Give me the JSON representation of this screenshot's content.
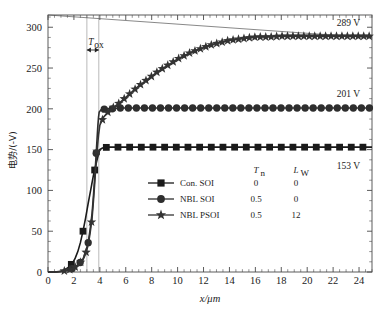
{
  "chart_data": {
    "type": "line",
    "title": "",
    "xlabel": "x/μm",
    "ylabel": "电势/(-V)",
    "ylabel_cjk": "电势",
    "ylabel_unit": "/(-V)",
    "xlim": [
      0,
      25
    ],
    "ylim": [
      0,
      315
    ],
    "xticks": [
      0,
      2,
      4,
      6,
      8,
      10,
      12,
      14,
      16,
      18,
      20,
      22,
      24
    ],
    "xtick_labels": [
      "0",
      "2",
      "4",
      "6",
      "8",
      "10",
      "12",
      "14",
      "16",
      "18",
      "20",
      "22",
      "24"
    ],
    "yticks": [
      0,
      50,
      100,
      150,
      200,
      250,
      300
    ],
    "ytick_labels": [
      "0",
      "50",
      "100",
      "150",
      "200",
      "250",
      "300"
    ],
    "x_minor_step": 0.5,
    "y_minor_step": 12.5,
    "grid": false,
    "legend_position": "lower-center",
    "series": [
      {
        "name": "Con. SOI",
        "marker": "square",
        "color": "#1a1a1a",
        "plateau": 153,
        "plateau_label": "153 V",
        "Tn": "0",
        "Lw": "0",
        "x": [
          0,
          0.5,
          1.0,
          1.3,
          1.6,
          1.9,
          2.1,
          2.3,
          2.5,
          2.7,
          2.9,
          3.1,
          3.3,
          3.5,
          3.7,
          3.9,
          4.0,
          4.2,
          4.6,
          5.2,
          6,
          7,
          8,
          9,
          10,
          11,
          12,
          13,
          14,
          15,
          16,
          17,
          18,
          19,
          20,
          21,
          22,
          23,
          24,
          25
        ],
        "y": [
          0,
          0,
          1,
          3,
          6,
          11,
          17,
          25,
          36,
          50,
          66,
          84,
          101,
          118,
          132,
          145,
          150,
          152,
          153,
          153,
          153,
          153,
          153,
          153,
          153,
          153,
          153,
          153,
          153,
          153,
          153,
          153,
          153,
          153,
          153,
          153,
          153,
          153,
          153,
          153
        ]
      },
      {
        "name": "NBL SOI",
        "marker": "circle",
        "color": "#2e2e2e",
        "plateau": 201,
        "plateau_label": "201 V",
        "Tn": "0.5",
        "Lw": "0",
        "x": [
          0,
          0.6,
          1.2,
          1.7,
          2.1,
          2.4,
          2.7,
          2.9,
          3.1,
          3.25,
          3.4,
          3.5,
          3.6,
          3.7,
          3.78,
          3.85,
          3.9,
          3.95,
          4.1,
          4.5,
          5.0,
          5.5,
          6,
          7,
          8,
          9,
          10,
          11,
          12,
          13,
          14,
          15,
          16,
          17,
          18,
          19,
          20,
          21,
          22,
          23,
          24,
          25
        ],
        "y": [
          0,
          0,
          1,
          3,
          6,
          10,
          16,
          24,
          36,
          52,
          72,
          92,
          115,
          140,
          162,
          180,
          190,
          196,
          199,
          200,
          200,
          201,
          201,
          201,
          201,
          201,
          201,
          201,
          201,
          201,
          201,
          201,
          201,
          201,
          201,
          201,
          201,
          201,
          201,
          201,
          201,
          201
        ]
      },
      {
        "name": "NBL PSOI",
        "marker": "star",
        "color": "#333333",
        "plateau": 289,
        "plateau_label": "289 V",
        "Tn": "0.5",
        "Lw": "12",
        "x": [
          0,
          0.6,
          1.2,
          1.7,
          2.1,
          2.4,
          2.7,
          2.9,
          3.1,
          3.25,
          3.4,
          3.5,
          3.6,
          3.7,
          3.8,
          3.9,
          4.0,
          4.3,
          4.8,
          5.5,
          6,
          6.5,
          7,
          7.5,
          8,
          8.5,
          9,
          9.5,
          10,
          10.5,
          11,
          11.5,
          12,
          12.5,
          13,
          13.5,
          14,
          14.5,
          15,
          15.5,
          16,
          17,
          18,
          19,
          20,
          21,
          22,
          23,
          24,
          25
        ],
        "y": [
          0,
          0,
          1,
          3,
          6,
          10,
          15,
          22,
          33,
          48,
          66,
          86,
          108,
          132,
          152,
          168,
          180,
          190,
          199,
          207,
          214,
          221,
          228,
          234,
          240,
          246,
          251,
          256,
          261,
          265,
          269,
          272,
          275,
          278,
          280,
          282,
          284,
          285,
          286,
          287,
          288,
          288,
          289,
          289,
          289,
          289,
          289,
          289,
          289,
          289
        ]
      }
    ],
    "annotations": [
      {
        "name": "Tox-bracket",
        "label": "T",
        "sublabel": "ox",
        "x_from": 3.0,
        "x_to": 3.92,
        "y": 272
      },
      {
        "name": "guide-line",
        "description": "thin straight reference line",
        "x_from": 0.0,
        "y_from": 315,
        "x_to": 25.0,
        "y_to": 287
      }
    ],
    "legend_headers": {
      "col1": "T",
      "col1_sub": "n",
      "col2": "L",
      "col2_sub": "W"
    }
  }
}
